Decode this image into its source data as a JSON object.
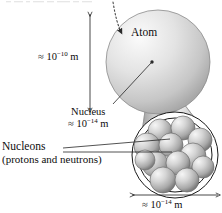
{
  "figure": {
    "title_cropped": "a cross-sectional view of",
    "labels": {
      "atom": "Atom",
      "atom_diameter_prefix": "≈ 10",
      "atom_diameter_exponent": "−10",
      "atom_diameter_unit": " m",
      "nucleus": "Nucleus",
      "nucleus_diameter_prefix": "≈ 10",
      "nucleus_diameter_exponent": "−14",
      "nucleus_diameter_unit": " m",
      "nucleons": "Nucleons",
      "nucleons_sub": "(protons and neutrons)",
      "nucleus_scale_prefix": "≈ 10",
      "nucleus_scale_exponent": "−14",
      "nucleus_scale_unit": " m"
    },
    "colors": {
      "background": "#ffffff",
      "text": "#0d0d0d",
      "line": "#1a1a1a",
      "sphere_light": "#f2f2f2",
      "sphere_mid": "#c9c9c9",
      "sphere_dark": "#8f8f8f",
      "cone_light": "#ededed",
      "cone_dark": "#b5b5b5"
    },
    "geometry": {
      "atom_center_x": 158,
      "atom_center_y": 62,
      "atom_radius": 52,
      "nucleus_center_x": 175,
      "nucleus_center_y": 155,
      "nucleus_outer_radius": 43,
      "nucleus_inner_radius": 37,
      "nucleon_count": 12,
      "dim_line_atom_x": 90,
      "dim_line_atom_y_top": 14,
      "dim_line_atom_y_bottom": 110,
      "dim_line_nuc_y": 195,
      "dim_line_nuc_x_left": 132,
      "dim_line_nuc_x_right": 218
    },
    "nucleons": [
      {
        "cx": 160,
        "cy": 131,
        "r": 12
      },
      {
        "cx": 183,
        "cy": 128,
        "r": 12
      },
      {
        "cx": 200,
        "cy": 140,
        "r": 12
      },
      {
        "cx": 147,
        "cy": 146,
        "r": 13
      },
      {
        "cx": 171,
        "cy": 145,
        "r": 12
      },
      {
        "cx": 193,
        "cy": 156,
        "r": 13
      },
      {
        "cx": 155,
        "cy": 164,
        "r": 13
      },
      {
        "cx": 178,
        "cy": 163,
        "r": 12
      },
      {
        "cx": 203,
        "cy": 167,
        "r": 11
      },
      {
        "cx": 163,
        "cy": 180,
        "r": 13
      },
      {
        "cx": 187,
        "cy": 180,
        "r": 12
      },
      {
        "cx": 145,
        "cy": 160,
        "r": 10
      }
    ]
  }
}
